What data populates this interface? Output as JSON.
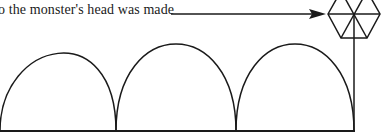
{
  "diagram": {
    "caption": "o the monster's head was made",
    "stroke_color": "#1a1a1a",
    "background": "#ffffff",
    "elements": {
      "pointer_arrow": "arrow from caption to hexagon head",
      "head": "hexagon divided into six triangles",
      "body": "three semicircular arcs along a baseline",
      "neck": "vertical line from head center to baseline"
    }
  }
}
